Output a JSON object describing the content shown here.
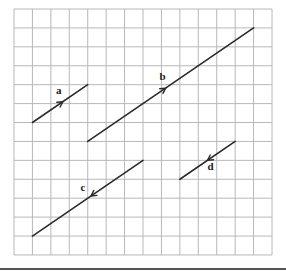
{
  "diagram": {
    "type": "vector-grid",
    "grid": {
      "columns": 14,
      "rows": 13,
      "origin_px": [
        14,
        9
      ],
      "cell_w": 18.43,
      "cell_h": 18.92,
      "line_color": "#b8b8b8"
    },
    "vector_color": "#2a2a2a",
    "vectors": [
      {
        "label": "a",
        "start": [
          1,
          6
        ],
        "end": [
          4,
          4
        ],
        "arrow_t": 0.55,
        "label_offset": [
          -4,
          -8
        ]
      },
      {
        "label": "b",
        "start": [
          4,
          7
        ],
        "end": [
          13,
          1
        ],
        "arrow_t": 0.47,
        "label_offset": [
          -3,
          -8
        ]
      },
      {
        "label": "c",
        "start": [
          7,
          8
        ],
        "end": [
          1,
          12
        ],
        "arrow_t": 0.47,
        "label_offset": [
          -8,
          -5
        ]
      },
      {
        "label": "d",
        "start": [
          12,
          7
        ],
        "end": [
          9,
          9
        ],
        "arrow_t": 0.5,
        "label_offset": [
          3,
          10
        ]
      }
    ],
    "bottom_rule": {
      "y": 269,
      "color": "#555555"
    }
  }
}
